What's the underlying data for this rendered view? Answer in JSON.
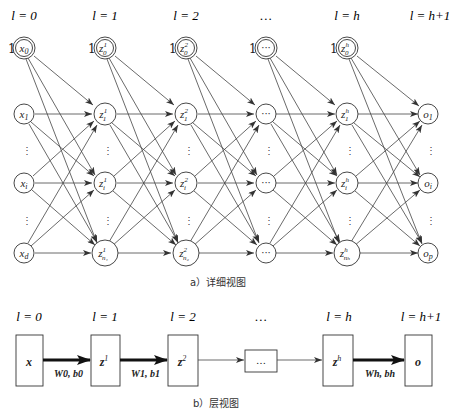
{
  "detailed_view": {
    "caption": "a）详细视图",
    "layer_labels": [
      "l = 0",
      "l = 1",
      "l = 2",
      "…",
      "l = h",
      "l = h+1"
    ],
    "bias_prefix": "1",
    "columns": [
      {
        "bias": "x0",
        "nodes": [
          "x1",
          "xi",
          "xd"
        ]
      },
      {
        "bias": "z0^1",
        "nodes": [
          "z1^1",
          "zi^1",
          "zn1^1"
        ]
      },
      {
        "bias": "z0^2",
        "nodes": [
          "z1^2",
          "zi^2",
          "zn2^2"
        ]
      },
      {
        "bias": "…",
        "nodes": [
          "…",
          "…",
          "…"
        ]
      },
      {
        "bias": "z0^h",
        "nodes": [
          "z1^h",
          "zi^h",
          "znh^h"
        ]
      },
      {
        "bias": null,
        "nodes": [
          "o1",
          "oi",
          "op"
        ]
      }
    ],
    "ellipsis_vertical": "⋮"
  },
  "layer_view": {
    "caption": "b）层视图",
    "layer_labels": [
      "l = 0",
      "l = 1",
      "l = 2",
      "…",
      "l = h",
      "l = h+1"
    ],
    "boxes": [
      "x",
      "z1",
      "z2",
      "…",
      "zh",
      "o"
    ],
    "edge_labels": [
      "W0, b0",
      "W1, b1",
      "Wh, bh"
    ]
  }
}
